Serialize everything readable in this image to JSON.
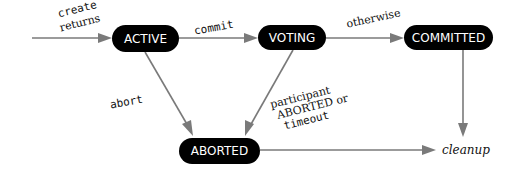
{
  "diagram": {
    "type": "state-machine",
    "nodes": {
      "active": {
        "label": "ACTIVE"
      },
      "voting": {
        "label": "VOTING"
      },
      "committed": {
        "label": "COMMITTED"
      },
      "aborted": {
        "label": "ABORTED"
      }
    },
    "terminal": {
      "label": "cleanup"
    },
    "edges": {
      "create": {
        "line1": "create",
        "line2": "returns",
        "from": "start",
        "to": "ACTIVE"
      },
      "commit": {
        "label": "commit",
        "from": "ACTIVE",
        "to": "VOTING"
      },
      "otherwise": {
        "label": "otherwise",
        "from": "VOTING",
        "to": "COMMITTED"
      },
      "abort": {
        "label": "abort",
        "from": "ACTIVE",
        "to": "ABORTED"
      },
      "participant": {
        "line1": "participant",
        "line2": "ABORTED or",
        "line3": "timeout",
        "from": "VOTING",
        "to": "ABORTED"
      },
      "committed_cleanup": {
        "from": "COMMITTED",
        "to": "cleanup"
      },
      "aborted_cleanup": {
        "from": "ABORTED",
        "to": "cleanup"
      }
    },
    "colors": {
      "node_fill": "#000000",
      "node_text": "#ffffff",
      "edge": "#7a7a7a"
    }
  }
}
